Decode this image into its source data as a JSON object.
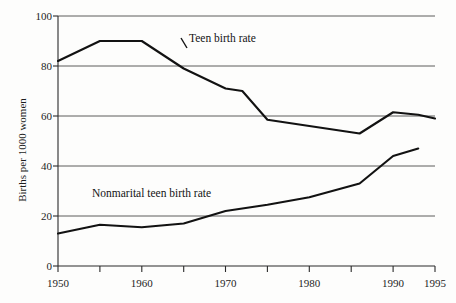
{
  "chart_data": {
    "type": "line",
    "title": "",
    "xlabel": "",
    "ylabel": "Births per 1000 women",
    "xlim": [
      1950,
      1995
    ],
    "ylim": [
      0,
      100
    ],
    "grid": true,
    "legend_position": "inline-annotations",
    "x_ticks": [
      1950,
      1960,
      1970,
      1980,
      1990,
      1995
    ],
    "x_tick_labels": [
      "1950",
      "1960",
      "1970",
      "1980",
      "1990",
      "1995"
    ],
    "x_minor_ticks": [
      1955,
      1965,
      1975,
      1985
    ],
    "y_ticks": [
      0,
      20,
      40,
      60,
      80,
      100
    ],
    "y_tick_labels": [
      "0",
      "20",
      "40",
      "60",
      "80",
      "100"
    ],
    "series": [
      {
        "name": "Teen birth rate",
        "label_text": "Teen birth rate",
        "color": "#121212",
        "x": [
          1950,
          1955,
          1960,
          1965,
          1970,
          1972,
          1975,
          1980,
          1986,
          1990,
          1993,
          1995
        ],
        "values": [
          82,
          90,
          90,
          79,
          71,
          70,
          58.5,
          56,
          53,
          61.5,
          60.5,
          59
        ]
      },
      {
        "name": "Nonmarital teen birth rate",
        "label_text": "Nonmarital teen birth rate",
        "color": "#121212",
        "x": [
          1950,
          1955,
          1960,
          1965,
          1970,
          1975,
          1980,
          1986,
          1990,
          1993
        ],
        "values": [
          13,
          16.5,
          15.5,
          17,
          22,
          24.5,
          27.5,
          33,
          44,
          47
        ]
      }
    ],
    "annotations": [
      {
        "text": "Teen birth rate",
        "x": 1963.5,
        "y": 88
      },
      {
        "text": "Nonmarital teen birth rate",
        "x": 1954.5,
        "y": 30
      }
    ]
  },
  "axis": {
    "y_title": "Births per 1000 women"
  }
}
